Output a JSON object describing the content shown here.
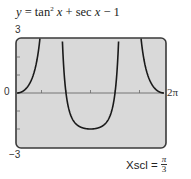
{
  "chart_data": {
    "type": "line",
    "title_parts": {
      "lhs": "y",
      "eq": " = tan",
      "sup": "2",
      "x1": " x",
      "rest": " + sec ",
      "x2": "x",
      "tail": " − 1"
    },
    "function": "tan(x)^2 + sec(x) - 1",
    "xlim": [
      0,
      6.283185307
    ],
    "ylim": [
      -3,
      3
    ],
    "x_tick_step": 1.047197551,
    "y_tick_step": 1,
    "asymptotes": [
      1.570796327,
      4.71238898
    ],
    "zeros": [
      0,
      2.094395102,
      4.188790205,
      6.283185307
    ],
    "minimum": {
      "x": 3.141592654,
      "y": -2
    },
    "labels": {
      "ymax": "3",
      "ymin": "−3",
      "xmin": "0",
      "xmax": "2π"
    },
    "xscl": {
      "label": "Xscl =",
      "num": "π",
      "den": "3"
    },
    "grid": false,
    "legend": null
  },
  "colors": {
    "plot_bg": "#d9d9d9",
    "frame": "#3a3a3a",
    "curve": "#1a1a1a",
    "axis": "#6a6a6a"
  }
}
